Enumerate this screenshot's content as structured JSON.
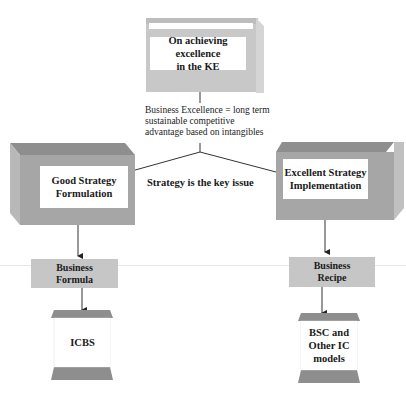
{
  "diagram": {
    "top": {
      "title_line1": "On achieving excellence",
      "title_line2": "in the KE"
    },
    "definition": {
      "line1": "Business Excellence = long term",
      "line2": "sustainable competitive",
      "line3": "advantage based on intangibles"
    },
    "center_label": "Strategy is the key issue",
    "left_branch": {
      "box_line1": "Good Strategy",
      "box_line2": "Formulation",
      "mid_line1": "Business",
      "mid_line2": "Formula",
      "bottom": "ICBS"
    },
    "right_branch": {
      "box_line1": "Excellent Strategy",
      "box_line2": "Implementation",
      "mid_line1": "Business",
      "mid_line2": "Recipe",
      "bottom_line1": "BSC and",
      "bottom_line2": "Other IC",
      "bottom_line3": "models"
    },
    "colors": {
      "box_gray": "#a9a9a9",
      "box_light": "#c8c8c8",
      "box_dark": "#8c8c8c",
      "line": "#333333"
    }
  }
}
